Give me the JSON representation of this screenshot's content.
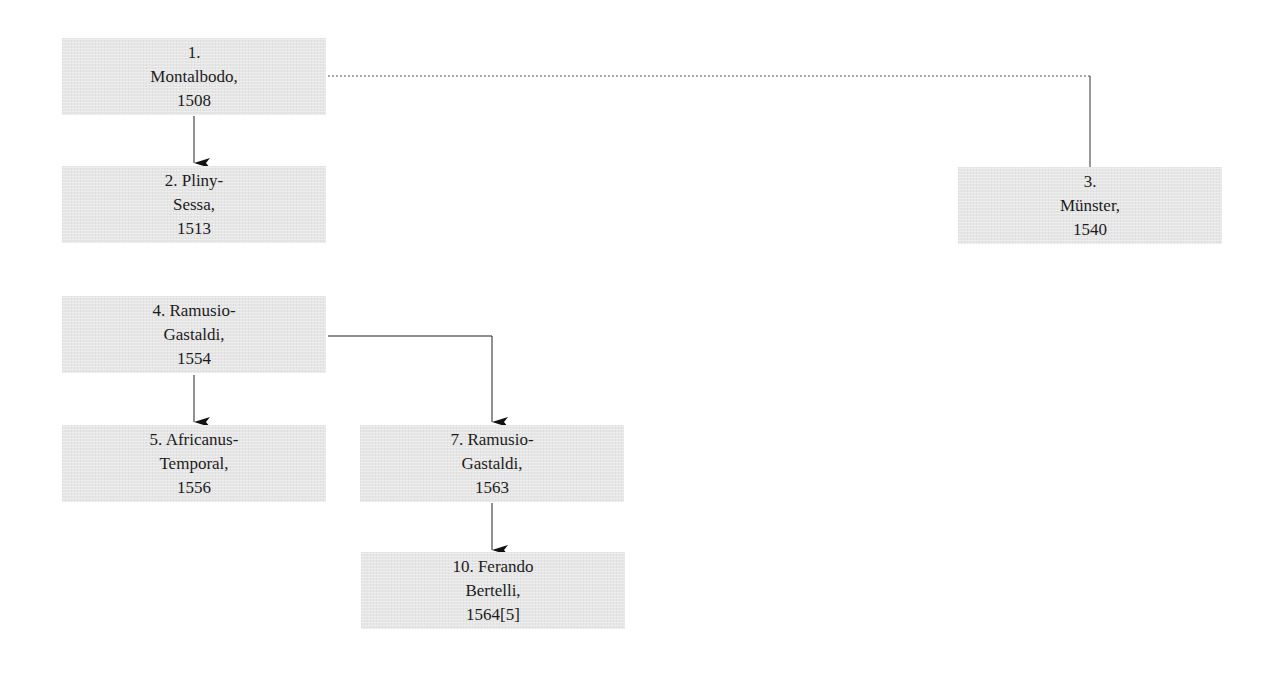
{
  "diagram": {
    "nodes": [
      {
        "id": "1",
        "lines": [
          "1.",
          "Montalbodo,",
          "1508"
        ]
      },
      {
        "id": "2",
        "lines": [
          "2. Pliny-",
          "Sessa,",
          "1513"
        ]
      },
      {
        "id": "3",
        "lines": [
          "3.",
          "Münster,",
          "1540"
        ]
      },
      {
        "id": "4",
        "lines": [
          "4. Ramusio-",
          "Gastaldi,",
          "1554"
        ]
      },
      {
        "id": "5",
        "lines": [
          "5. Africanus-",
          "Temporal,",
          "1556"
        ]
      },
      {
        "id": "7",
        "lines": [
          "7. Ramusio-",
          "Gastaldi,",
          "1563"
        ]
      },
      {
        "id": "10",
        "lines": [
          "10. Ferando",
          "Bertelli,",
          "1564[5]"
        ]
      }
    ],
    "edges": [
      {
        "from": "1",
        "to": "2",
        "style": "solid",
        "arrow": true
      },
      {
        "from": "1",
        "to": "3",
        "style": "dotted-then-solid",
        "arrow": false
      },
      {
        "from": "4",
        "to": "5",
        "style": "solid",
        "arrow": true
      },
      {
        "from": "4",
        "to": "7",
        "style": "solid",
        "arrow": true
      },
      {
        "from": "7",
        "to": "10",
        "style": "solid",
        "arrow": true
      }
    ],
    "colors": {
      "node_fill": "#e6e6e6",
      "text": "#1c1c1c",
      "line": "#222222"
    }
  }
}
